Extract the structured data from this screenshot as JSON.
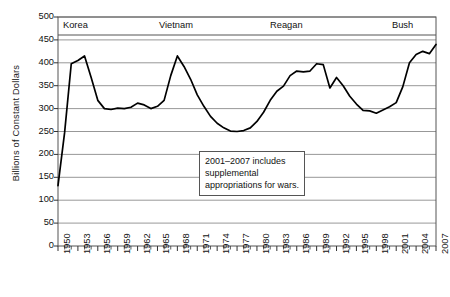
{
  "chart_data": {
    "type": "line",
    "title": "",
    "subtitle": "",
    "xlabel": "",
    "ylabel": "Billions of Constant Dollars",
    "xlim": [
      1950,
      2007
    ],
    "ylim": [
      0,
      500
    ],
    "ytick_step": 50,
    "xtick_label_step": 3,
    "grid": "horizontal",
    "legend": "none",
    "line_color": "#000000",
    "grid_color": "#8c8c8c",
    "frame_color": "#555555",
    "yticks": [
      0,
      50,
      100,
      150,
      200,
      250,
      300,
      350,
      400,
      450,
      500
    ],
    "xticks": [
      1950,
      1953,
      1956,
      1959,
      1962,
      1965,
      1968,
      1971,
      1974,
      1977,
      1980,
      1983,
      1986,
      1989,
      1992,
      1995,
      1998,
      2001,
      2004,
      2007
    ],
    "x": [
      1950,
      1951,
      1952,
      1953,
      1954,
      1955,
      1956,
      1957,
      1958,
      1959,
      1960,
      1961,
      1962,
      1963,
      1964,
      1965,
      1966,
      1967,
      1968,
      1969,
      1970,
      1971,
      1972,
      1973,
      1974,
      1975,
      1976,
      1977,
      1978,
      1979,
      1980,
      1981,
      1982,
      1983,
      1984,
      1985,
      1986,
      1987,
      1988,
      1989,
      1990,
      1991,
      1992,
      1993,
      1994,
      1995,
      1996,
      1997,
      1998,
      1999,
      2000,
      2001,
      2002,
      2003,
      2004,
      2005,
      2006,
      2007
    ],
    "values": [
      132,
      248,
      398,
      405,
      415,
      368,
      318,
      300,
      298,
      301,
      300,
      303,
      312,
      308,
      300,
      305,
      318,
      372,
      415,
      392,
      364,
      330,
      305,
      283,
      268,
      258,
      251,
      250,
      252,
      258,
      272,
      292,
      318,
      338,
      349,
      372,
      382,
      380,
      382,
      398,
      396,
      345,
      368,
      350,
      327,
      310,
      296,
      295,
      290,
      297,
      304,
      313,
      348,
      400,
      418,
      425,
      420,
      440
    ],
    "annotations": [
      {
        "name": "supplemental-appropriations-note",
        "lines": [
          "2001–2007 includes",
          "supplemental",
          "appropriations for wars."
        ],
        "x_box_px": 199,
        "y_box_px": 151
      }
    ],
    "era_labels": [
      {
        "name": "korea",
        "label": "Korea",
        "x_px": 63
      },
      {
        "name": "vietnam",
        "label": "Vietnam",
        "x_px": 159
      },
      {
        "name": "reagan",
        "label": "Reagan",
        "x_px": 270
      },
      {
        "name": "bush",
        "label": "Bush",
        "x_px": 392
      }
    ]
  },
  "axes": {
    "y_title": "Billions of Constant Dollars",
    "y_tick_labels": [
      "500",
      "450",
      "400",
      "350",
      "300",
      "250",
      "200",
      "150",
      "100",
      "50",
      "0"
    ],
    "x_tick_labels": [
      "1950",
      "1953",
      "1956",
      "1959",
      "1962",
      "1965",
      "1968",
      "1971",
      "1974",
      "1977",
      "1980",
      "1983",
      "1986",
      "1989",
      "1992",
      "1995",
      "1998",
      "2001",
      "2004",
      "2007"
    ]
  },
  "eras": {
    "korea": "Korea",
    "vietnam": "Vietnam",
    "reagan": "Reagan",
    "bush": "Bush"
  },
  "annotation": {
    "line1": "2001–2007 includes",
    "line2": "supplemental",
    "line3": "appropriations for wars."
  }
}
